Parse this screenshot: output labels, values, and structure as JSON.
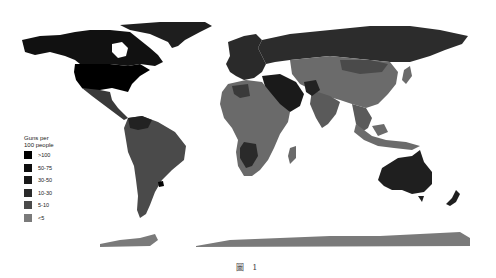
{
  "map": {
    "subject": "Guns per 100 people",
    "projection": "world",
    "regions": {
      "north_america": {
        "color": "#000000",
        "bin": ">100"
      },
      "canada": {
        "color": "#111111",
        "bin": "30-50"
      },
      "greenland": {
        "color": "#1e1e1e"
      },
      "central_america": {
        "color": "#3a3a3a"
      },
      "south_america": {
        "color": "#4a4a4a"
      },
      "europe": {
        "color": "#2a2a2a"
      },
      "russia": {
        "color": "#2c2c2c"
      },
      "middle_east": {
        "color": "#1a1a1a"
      },
      "africa": {
        "color": "#6a6a6a"
      },
      "southern_africa": {
        "color": "#2a2a2a"
      },
      "asia": {
        "color": "#6b6b6b"
      },
      "mongolia": {
        "color": "#4a4a4a"
      },
      "southeast_asia": {
        "color": "#5a5a5a"
      },
      "australia": {
        "color": "#1f1f1f"
      },
      "new_zealand": {
        "color": "#1f1f1f"
      },
      "antarctica": {
        "color": "#7a7a7a"
      }
    }
  },
  "legend": {
    "title_line1": "Guns per",
    "title_line2": "100 people",
    "items": [
      {
        "label": ">100",
        "color": "#000000"
      },
      {
        "label": "50-75",
        "color": "#0e0e0e"
      },
      {
        "label": "30-50",
        "color": "#181818"
      },
      {
        "label": "10-30",
        "color": "#2a2a2a"
      },
      {
        "label": "5-10",
        "color": "#4a4a4a"
      },
      {
        "label": "<5",
        "color": "#7a7a7a"
      }
    ]
  },
  "caption": "圖 1"
}
